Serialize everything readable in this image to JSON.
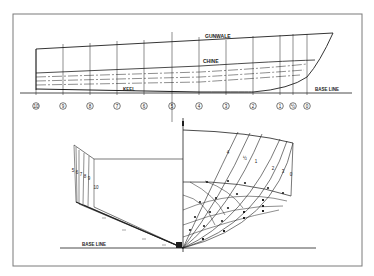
{
  "colors": {
    "background": "#ffffff",
    "frame": "#7a7a7a",
    "ink": "#1e1e1e"
  },
  "frame": {
    "x": 13,
    "y": 14,
    "w": 349,
    "h": 252
  },
  "profile": {
    "labels": {
      "gunwale": "GUNWALE",
      "chine": "CHINE",
      "keel": "KEEL",
      "base_line": "BASE LINE"
    },
    "stations": [
      {
        "label": "10",
        "x": 36
      },
      {
        "label": "9",
        "x": 63
      },
      {
        "label": "8",
        "x": 90
      },
      {
        "label": "7",
        "x": 117
      },
      {
        "label": "6",
        "x": 144
      },
      {
        "label": "5",
        "x": 172
      },
      {
        "label": "4",
        "x": 199
      },
      {
        "label": "3",
        "x": 226
      },
      {
        "label": "2",
        "x": 253
      },
      {
        "label": "1",
        "x": 280
      },
      {
        "label": "½",
        "x": 293
      },
      {
        "label": "0",
        "x": 307
      }
    ],
    "base_line_y": 93,
    "gunwale": {
      "stern": [
        36,
        49
      ],
      "bow": [
        333,
        33
      ]
    },
    "chine": {
      "stern": [
        36,
        73
      ],
      "bow": [
        315,
        60
      ]
    },
    "keel": {
      "stern": [
        36,
        90
      ],
      "bow_turn": [
        253,
        92
      ]
    }
  },
  "body_plan": {
    "labels": {
      "base_line": "BASE LINE",
      "centerline": "℄"
    },
    "centerline_x": 183,
    "base_line_y": 248,
    "aft_stations": [
      "5",
      "6",
      "7",
      "8",
      "9",
      "10"
    ],
    "fwd_stations": [
      "4",
      "½",
      "1",
      "2",
      "3",
      "0"
    ]
  }
}
